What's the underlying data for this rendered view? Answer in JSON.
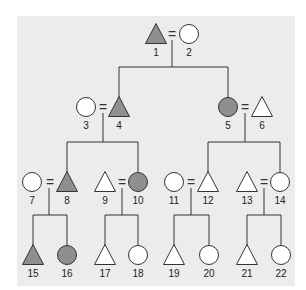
{
  "diagram": {
    "type": "pedigree",
    "colors": {
      "affected": "#8f8f8f",
      "unaffected": "#ffffff",
      "stroke": "#333333",
      "background": "#ececec"
    },
    "individuals": [
      {
        "id": "1",
        "label": "1",
        "shape": "triangle",
        "affected": true,
        "x": 156,
        "y": 34
      },
      {
        "id": "2",
        "label": "2",
        "shape": "circle",
        "affected": false,
        "x": 189,
        "y": 34
      },
      {
        "id": "3",
        "label": "3",
        "shape": "circle",
        "affected": false,
        "x": 86,
        "y": 107
      },
      {
        "id": "4",
        "label": "4",
        "shape": "triangle",
        "affected": true,
        "x": 119,
        "y": 107
      },
      {
        "id": "5",
        "label": "5",
        "shape": "circle",
        "affected": true,
        "x": 228,
        "y": 107
      },
      {
        "id": "6",
        "label": "6",
        "shape": "triangle",
        "affected": false,
        "x": 262,
        "y": 107
      },
      {
        "id": "7",
        "label": "7",
        "shape": "circle",
        "affected": false,
        "x": 32,
        "y": 182
      },
      {
        "id": "8",
        "label": "8",
        "shape": "triangle",
        "affected": true,
        "x": 67,
        "y": 182
      },
      {
        "id": "9",
        "label": "9",
        "shape": "triangle",
        "affected": false,
        "x": 105,
        "y": 182
      },
      {
        "id": "10",
        "label": "10",
        "shape": "circle",
        "affected": true,
        "x": 138,
        "y": 182
      },
      {
        "id": "11",
        "label": "11",
        "shape": "circle",
        "affected": false,
        "x": 174,
        "y": 182
      },
      {
        "id": "12",
        "label": "12",
        "shape": "triangle",
        "affected": false,
        "x": 208,
        "y": 182
      },
      {
        "id": "13",
        "label": "13",
        "shape": "triangle",
        "affected": false,
        "x": 247,
        "y": 182
      },
      {
        "id": "14",
        "label": "14",
        "shape": "circle",
        "affected": false,
        "x": 280,
        "y": 182
      },
      {
        "id": "15",
        "label": "15",
        "shape": "triangle",
        "affected": true,
        "x": 33,
        "y": 255
      },
      {
        "id": "16",
        "label": "16",
        "shape": "circle",
        "affected": true,
        "x": 67,
        "y": 255
      },
      {
        "id": "17",
        "label": "17",
        "shape": "triangle",
        "affected": false,
        "x": 105,
        "y": 255
      },
      {
        "id": "18",
        "label": "18",
        "shape": "circle",
        "affected": false,
        "x": 138,
        "y": 255
      },
      {
        "id": "19",
        "label": "19",
        "shape": "triangle",
        "affected": false,
        "x": 174,
        "y": 255
      },
      {
        "id": "20",
        "label": "20",
        "shape": "circle",
        "affected": false,
        "x": 209,
        "y": 255
      },
      {
        "id": "21",
        "label": "21",
        "shape": "triangle",
        "affected": false,
        "x": 247,
        "y": 255
      },
      {
        "id": "22",
        "label": "22",
        "shape": "circle",
        "affected": false,
        "x": 281,
        "y": 255
      }
    ],
    "marriages": [
      {
        "partners": [
          "1",
          "2"
        ],
        "eq_x": 172,
        "y": 34,
        "drop_x": 172,
        "children": [
          "4",
          "5"
        ]
      },
      {
        "partners": [
          "3",
          "4"
        ],
        "eq_x": 103,
        "y": 107,
        "drop_x": 103,
        "children": [
          "8",
          "10"
        ]
      },
      {
        "partners": [
          "5",
          "6"
        ],
        "eq_x": 245,
        "y": 107,
        "drop_x": 245,
        "children": [
          "12",
          "14"
        ]
      },
      {
        "partners": [
          "7",
          "8"
        ],
        "eq_x": 50,
        "y": 182,
        "drop_x": 49,
        "children": [
          "15",
          "16"
        ]
      },
      {
        "partners": [
          "9",
          "10"
        ],
        "eq_x": 122,
        "y": 182,
        "drop_x": 122,
        "children": [
          "17",
          "18"
        ]
      },
      {
        "partners": [
          "11",
          "12"
        ],
        "eq_x": 191,
        "y": 182,
        "drop_x": 191,
        "children": [
          "19",
          "20"
        ]
      },
      {
        "partners": [
          "13",
          "14"
        ],
        "eq_x": 264,
        "y": 182,
        "drop_x": 264,
        "children": [
          "21",
          "22"
        ]
      }
    ],
    "equals_symbol": "="
  }
}
